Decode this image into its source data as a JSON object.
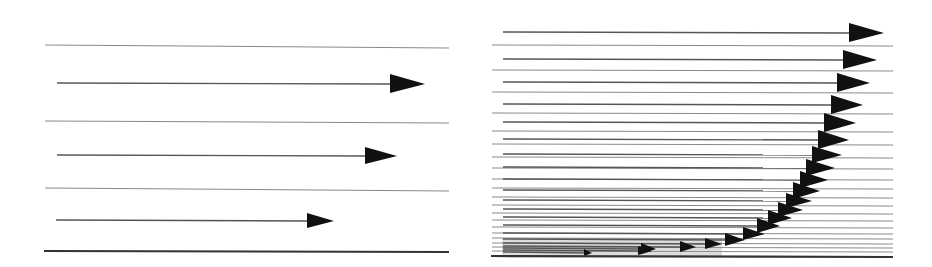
{
  "figure": {
    "title": "",
    "colors": {
      "background": "#ffffff",
      "arrow": "#111111",
      "streamline": "#8a8a8a",
      "wall": "#333333"
    }
  },
  "panels": [
    {
      "id": "laminar",
      "label": "",
      "x0": 45,
      "x1": 449,
      "wall_y": 251,
      "streamlines": [
        {
          "y": 45,
          "y2": 48
        },
        {
          "y": 121,
          "y2": 123
        },
        {
          "y": 188,
          "y2": 191
        }
      ],
      "arrows": [
        {
          "y": 83,
          "x_start": 57,
          "x_tip": 425,
          "head_len": 35,
          "head_half": 9
        },
        {
          "y": 155,
          "x_start": 57,
          "x_tip": 397,
          "head_len": 32,
          "head_half": 8
        },
        {
          "y": 220,
          "x_start": 56,
          "x_tip": 334,
          "head_len": 27,
          "head_half": 7
        }
      ]
    },
    {
      "id": "turbulent",
      "label": "",
      "x0": 492,
      "x1": 893,
      "wall_y": 256,
      "streamlines": [
        {
          "y": 45
        },
        {
          "y": 70
        },
        {
          "y": 92
        },
        {
          "y": 113
        },
        {
          "y": 131
        },
        {
          "y": 144
        },
        {
          "y": 157
        },
        {
          "y": 168
        },
        {
          "y": 179
        },
        {
          "y": 188
        },
        {
          "y": 197
        },
        {
          "y": 205
        },
        {
          "y": 213
        },
        {
          "y": 220
        },
        {
          "y": 227
        },
        {
          "y": 233
        },
        {
          "y": 238
        },
        {
          "y": 243
        },
        {
          "y": 247
        },
        {
          "y": 251
        }
      ],
      "arrows": [
        {
          "y": 32,
          "x_start": 503,
          "x_tip": 884,
          "head_len": 35,
          "head_half": 9
        },
        {
          "y": 59,
          "x_start": 503,
          "x_tip": 877,
          "head_len": 34,
          "head_half": 9
        },
        {
          "y": 82,
          "x_start": 503,
          "x_tip": 870,
          "head_len": 33,
          "head_half": 9
        },
        {
          "y": 104,
          "x_start": 503,
          "x_tip": 863,
          "head_len": 32,
          "head_half": 9
        },
        {
          "y": 122,
          "x_start": 503,
          "x_tip": 856,
          "head_len": 32,
          "head_half": 9
        },
        {
          "y": 139,
          "x_start": 503,
          "x_tip": 849,
          "head_len": 31,
          "head_half": 9
        },
        {
          "y": 154,
          "x_start": 503,
          "x_tip": 842,
          "head_len": 30,
          "head_half": 8
        },
        {
          "y": 167,
          "x_start": 503,
          "x_tip": 835,
          "head_len": 29,
          "head_half": 8
        },
        {
          "y": 179,
          "x_start": 503,
          "x_tip": 828,
          "head_len": 28,
          "head_half": 8
        },
        {
          "y": 190,
          "x_start": 503,
          "x_tip": 820,
          "head_len": 27,
          "head_half": 8
        },
        {
          "y": 200,
          "x_start": 503,
          "x_tip": 812,
          "head_len": 26,
          "head_half": 7
        },
        {
          "y": 209,
          "x_start": 503,
          "x_tip": 803,
          "head_len": 25,
          "head_half": 7
        },
        {
          "y": 217,
          "x_start": 503,
          "x_tip": 792,
          "head_len": 24,
          "head_half": 7
        },
        {
          "y": 225,
          "x_start": 503,
          "x_tip": 780,
          "head_len": 23,
          "head_half": 7
        },
        {
          "y": 233,
          "x_start": 503,
          "x_tip": 765,
          "head_len": 22,
          "head_half": 6
        },
        {
          "y": 239,
          "x_start": 503,
          "x_tip": 745,
          "head_len": 20,
          "head_half": 6
        },
        {
          "y": 243,
          "x_start": 503,
          "x_tip": 722,
          "head_len": 17,
          "head_half": 5
        },
        {
          "y": 246,
          "x_start": 503,
          "x_tip": 696,
          "head_len": 16,
          "head_half": 5
        },
        {
          "y": 248,
          "x_start": 503,
          "x_tip": 656,
          "head_len": 15,
          "head_half": 5
        },
        {
          "y": 250,
          "x_start": 503,
          "x_tip": 652,
          "head_len": 14,
          "head_half": 4
        },
        {
          "y": 252,
          "x_start": 503,
          "x_tip": 592,
          "head_len": 8,
          "head_half": 3
        }
      ]
    }
  ]
}
